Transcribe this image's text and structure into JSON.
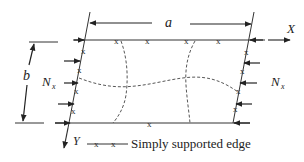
{
  "diagram": {
    "labels": {
      "length": "a",
      "width": "b",
      "load_left": "N",
      "load_left_sub": "x",
      "load_right": "N",
      "load_right_sub": "x",
      "axis_x": "X",
      "axis_y": "Y"
    },
    "support_marker": "x",
    "legend": {
      "text": "Simply supported edge",
      "symbol": "x x"
    },
    "colors": {
      "line": "#333333",
      "text": "#222222",
      "background": "#ffffff"
    }
  }
}
